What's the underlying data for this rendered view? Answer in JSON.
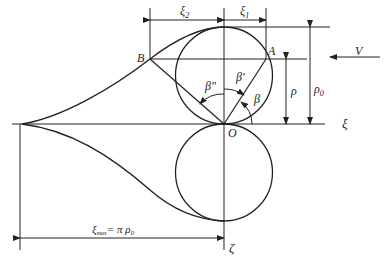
{
  "diagram": {
    "labels": {
      "B": "B",
      "A": "A",
      "O": "O",
      "V": "V",
      "xi": "ξ",
      "zeta": "ζ",
      "rho": "ρ",
      "rho0": "ρ",
      "rho0_sub": "0",
      "xi1": "ξ",
      "xi1_sub": "1",
      "xi2": "ξ",
      "xi2_sub": "2",
      "beta": "β",
      "beta_prime": "β'",
      "beta_dprime": "β\"",
      "xi_max": "ξ",
      "xi_max_sub": "max",
      "xi_max_eq": "= π ρ",
      "xi_max_eq_sub": "0"
    }
  }
}
